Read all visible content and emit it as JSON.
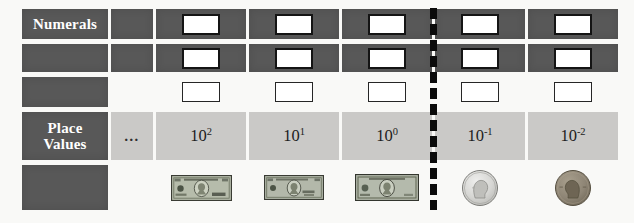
{
  "figure": {
    "background": "#f9f9f7",
    "divider_color": "#0b0b0b"
  },
  "colors": {
    "dark_cell": "#585858",
    "light_cell": "#cac9c7",
    "header_text": "#ffffff",
    "value_text": "#1c1c1c",
    "answer_box_fill": "#ffffff",
    "answer_box_border": "#141414",
    "bill_green": "#b6bcab",
    "dime_silver": "#d6d6d3",
    "penny_copper": "#968d7e"
  },
  "numerals_row": {
    "label": "Numerals"
  },
  "place_values_row": {
    "label": "Place Values",
    "ellipsis": "…",
    "values": [
      {
        "base": "10",
        "exp": "2"
      },
      {
        "base": "10",
        "exp": "1"
      },
      {
        "base": "10",
        "exp": "0"
      },
      {
        "base": "10",
        "exp": "-1"
      },
      {
        "base": "10",
        "exp": "-2"
      }
    ]
  },
  "money_row": {
    "items": [
      "hundred-dollar-bill",
      "ten-dollar-bill",
      "one-dollar-bill",
      "dime",
      "penny"
    ]
  }
}
